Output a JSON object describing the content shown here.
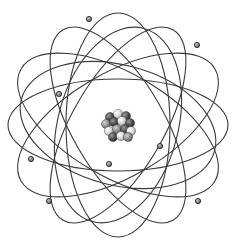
{
  "figure": {
    "subject": "Atom model",
    "components": [
      "nucleus",
      "electron orbits",
      "electrons"
    ],
    "colors": {
      "background": "#ffffff",
      "orbit_stroke": "#3a3a3a",
      "electron_fill": "#8a8a8a",
      "electron_stroke": "#2e2e2e",
      "nucleon_dark": "#4a4a4a",
      "nucleon_mid": "#8c8c8c",
      "nucleon_light": "#d6d6d6"
    },
    "center": [
      118,
      125
    ],
    "orbits": [
      {
        "rx": 112,
        "ry": 52,
        "angle": 30
      },
      {
        "rx": 112,
        "ry": 52,
        "angle": -30
      },
      {
        "rx": 112,
        "ry": 52,
        "angle": 90
      },
      {
        "rx": 110,
        "ry": 46,
        "angle": 60
      },
      {
        "rx": 110,
        "ry": 46,
        "angle": -60
      },
      {
        "rx": 110,
        "ry": 46,
        "angle": 0
      },
      {
        "rx": 100,
        "ry": 60,
        "angle": 15
      },
      {
        "rx": 100,
        "ry": 60,
        "angle": -75
      }
    ],
    "electrons": [
      {
        "x": 89,
        "y": 19
      },
      {
        "x": 59,
        "y": 94
      },
      {
        "x": 31,
        "y": 159
      },
      {
        "x": 49,
        "y": 201
      },
      {
        "x": 109,
        "y": 164
      },
      {
        "x": 160,
        "y": 146
      },
      {
        "x": 198,
        "y": 201
      },
      {
        "x": 197,
        "y": 45
      }
    ],
    "nucleons": [
      {
        "x": 110,
        "y": 117,
        "shade": "dark"
      },
      {
        "x": 118,
        "y": 114,
        "shade": "light"
      },
      {
        "x": 126,
        "y": 116,
        "shade": "dark"
      },
      {
        "x": 106,
        "y": 124,
        "shade": "mid"
      },
      {
        "x": 114,
        "y": 122,
        "shade": "dark"
      },
      {
        "x": 122,
        "y": 121,
        "shade": "light"
      },
      {
        "x": 130,
        "y": 123,
        "shade": "dark"
      },
      {
        "x": 109,
        "y": 131,
        "shade": "light"
      },
      {
        "x": 117,
        "y": 129,
        "shade": "mid"
      },
      {
        "x": 125,
        "y": 129,
        "shade": "dark"
      },
      {
        "x": 131,
        "y": 131,
        "shade": "light"
      },
      {
        "x": 113,
        "y": 137,
        "shade": "dark"
      },
      {
        "x": 121,
        "y": 136,
        "shade": "light"
      },
      {
        "x": 128,
        "y": 137,
        "shade": "mid"
      }
    ]
  }
}
